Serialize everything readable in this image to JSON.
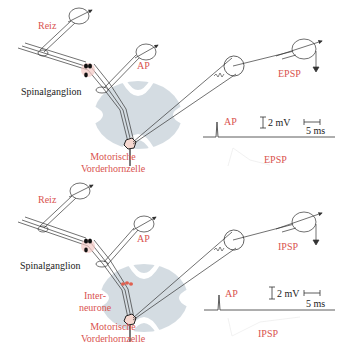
{
  "colors": {
    "label_red": "#d9534f",
    "label_black": "#222222",
    "spinal_cord_grey": "#cdd6dd",
    "synapse_red": "#e06050",
    "line": "#333333"
  },
  "panels": [
    {
      "id": "epsp",
      "labels": {
        "stimulus": "Reiz",
        "ap_electrode": "AP",
        "ganglion": "Spinalganglion",
        "motor_neuron_line1": "Motorische",
        "motor_neuron_line2": "Vorderhornzelle",
        "recording_electrode": "EPSP"
      },
      "trace": {
        "ap_label": "AP",
        "voltage_scale": "2 mV",
        "time_scale": "5 ms",
        "response_label": "EPSP"
      }
    },
    {
      "id": "ipsp",
      "labels": {
        "stimulus": "Reiz",
        "ap_electrode": "AP",
        "ganglion": "Spinalganglion",
        "interneuron_line1": "Inter-",
        "interneuron_line2": "neurone",
        "motor_neuron_line1": "Motorische",
        "motor_neuron_line2": "Vorderhornzelle",
        "recording_electrode": "IPSP"
      },
      "trace": {
        "ap_label": "AP",
        "voltage_scale": "2 mV",
        "time_scale": "5 ms",
        "response_label": "IPSP"
      }
    }
  ]
}
